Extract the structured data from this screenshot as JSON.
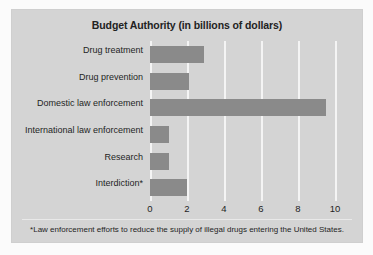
{
  "chart_data": {
    "type": "bar",
    "orientation": "horizontal",
    "title": "Budget Authority (in billions of dollars)",
    "xlabel": "",
    "ylabel": "",
    "xlim": [
      0,
      10
    ],
    "xticks": [
      "0",
      "2",
      "4",
      "6",
      "8",
      "10"
    ],
    "grid": true,
    "legend": null,
    "categories": [
      "Drug treatment",
      "Drug prevention",
      "Domestic law enforcement",
      "International law enforcement",
      "Research",
      "Interdiction*"
    ],
    "values": [
      2.9,
      2.1,
      9.5,
      1.0,
      1.0,
      2.0
    ],
    "annotations": [
      "*Law enforcement efforts to reduce the supply of illegal drugs entering the United States."
    ]
  },
  "footnote": "*Law enforcement efforts to reduce the supply of illegal drugs entering the United States.",
  "colors": {
    "bar": "#8a8a8a",
    "panel_background": "#d4d4d4",
    "gridline": "#f4f4f4",
    "text": "#1f1f1f"
  }
}
